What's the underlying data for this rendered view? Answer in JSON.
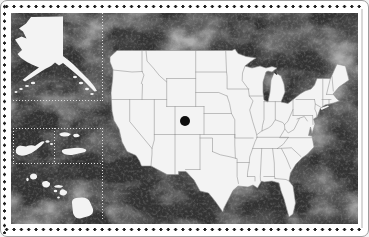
{
  "colors": {
    "card_bg": "#ffffff",
    "card_border": "#9c9c9c",
    "perforation_dot": "#1f1f1f",
    "board_base": "#333333",
    "board_light_patch": "#6b6b6b",
    "board_dark_patch": "#141414",
    "landmass": "#f3f3f3",
    "border_line": "#8f8f8f",
    "inset_dotted_line": "#dcdcdc",
    "marker": "#0d0d0d",
    "edge_line": "#d8d8d8"
  },
  "marker": {
    "cx": 76,
    "cy": 74,
    "r": 5
  },
  "regions": {
    "main_map": "contiguous-united-states",
    "inset_1": "alaska",
    "inset_2": "puerto-rico",
    "inset_3": "us-virgin-islands",
    "inset_4": "hawaii"
  }
}
